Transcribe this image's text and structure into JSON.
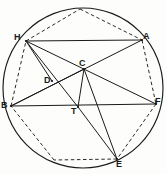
{
  "figure": {
    "background_color": "#fdfdfb",
    "stroke_color": "#1a1a1a",
    "dashed_color": "#2b2b2b",
    "label_color": "#1a1a1a",
    "width": 167,
    "height": 174
  },
  "circle": {
    "name": "circumscribed-circle",
    "cx": 83,
    "cy": 88,
    "r": 80,
    "style": "solid"
  },
  "points": [
    {
      "id": "H",
      "label": "H",
      "x": 26,
      "y": 41,
      "label_x": 14,
      "label_y": 33
    },
    {
      "id": "A",
      "label": "A",
      "x": 142,
      "y": 40,
      "label_x": 143,
      "label_y": 32
    },
    {
      "id": "B",
      "label": "B",
      "x": 11,
      "y": 106,
      "label_x": 1,
      "label_y": 101
    },
    {
      "id": "F",
      "label": "F",
      "x": 156,
      "y": 104,
      "label_x": 155,
      "label_y": 97
    },
    {
      "id": "E",
      "label": "E",
      "x": 117,
      "y": 159,
      "label_x": 116,
      "label_y": 160
    },
    {
      "id": "C",
      "label": "C",
      "x": 84,
      "y": 69,
      "label_x": 79,
      "label_y": 59
    },
    {
      "id": "D",
      "label": "D",
      "x": 52,
      "y": 81,
      "label_x": 44,
      "label_y": 76
    },
    {
      "id": "T",
      "label": "T",
      "x": 78,
      "y": 107,
      "label_x": 71,
      "label_y": 107
    },
    {
      "id": "P1",
      "label": "",
      "x": 80,
      "y": 9,
      "label_x": 0,
      "label_y": 0
    },
    {
      "id": "P2",
      "label": "",
      "x": 54,
      "y": 160,
      "label_x": 0,
      "label_y": 0
    }
  ],
  "solid_segments": [
    {
      "name": "chord-H-A",
      "from": "H",
      "to": "A"
    },
    {
      "name": "chord-B-F",
      "from": "B",
      "to": "F"
    },
    {
      "name": "chord-H-F",
      "from": "H",
      "to": "F"
    },
    {
      "name": "chord-B-A",
      "from": "B",
      "to": "A"
    },
    {
      "name": "chord-H-T",
      "from": "H",
      "to": "T"
    },
    {
      "name": "chord-H-D",
      "from": "H",
      "to": "D"
    },
    {
      "name": "chord-B-C",
      "from": "B",
      "to": "C"
    },
    {
      "name": "segment-C-T",
      "from": "C",
      "to": "T"
    },
    {
      "name": "chord-C-E",
      "from": "C",
      "to": "E"
    },
    {
      "name": "chord-T-E",
      "from": "T",
      "to": "E"
    }
  ],
  "dashed_segments": [
    {
      "name": "poly-edge-H-P1",
      "from": "H",
      "to": "P1"
    },
    {
      "name": "poly-edge-P1-A",
      "from": "P1",
      "to": "A"
    },
    {
      "name": "poly-edge-A-F",
      "from": "A",
      "to": "F"
    },
    {
      "name": "poly-edge-F-E",
      "from": "F",
      "to": "E"
    },
    {
      "name": "poly-edge-E-P2",
      "from": "E",
      "to": "P2"
    },
    {
      "name": "poly-edge-P2-B",
      "from": "P2",
      "to": "B"
    },
    {
      "name": "poly-edge-B-H",
      "from": "B",
      "to": "H"
    }
  ]
}
